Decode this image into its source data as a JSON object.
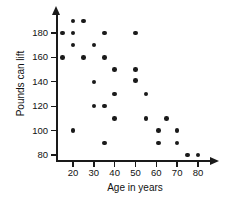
{
  "chart_data": {
    "type": "scatter",
    "title": "",
    "xlabel": "Age in years",
    "ylabel": "Pounds can lift",
    "xlim": [
      0,
      85
    ],
    "ylim": [
      70,
      195
    ],
    "grid": false,
    "legend": "none",
    "xticks": [
      20,
      30,
      40,
      50,
      60,
      70,
      80
    ],
    "yticks": [
      80,
      100,
      120,
      140,
      160,
      180
    ],
    "points": [
      {
        "x": 15,
        "y": 180
      },
      {
        "x": 15,
        "y": 160
      },
      {
        "x": 20,
        "y": 190
      },
      {
        "x": 20,
        "y": 180
      },
      {
        "x": 20,
        "y": 170
      },
      {
        "x": 20,
        "y": 100
      },
      {
        "x": 25,
        "y": 190
      },
      {
        "x": 25,
        "y": 160
      },
      {
        "x": 30,
        "y": 170
      },
      {
        "x": 30,
        "y": 140
      },
      {
        "x": 30,
        "y": 120
      },
      {
        "x": 35,
        "y": 180
      },
      {
        "x": 35,
        "y": 160
      },
      {
        "x": 35,
        "y": 120
      },
      {
        "x": 35,
        "y": 90
      },
      {
        "x": 40,
        "y": 150
      },
      {
        "x": 40,
        "y": 130
      },
      {
        "x": 40,
        "y": 110
      },
      {
        "x": 50,
        "y": 180
      },
      {
        "x": 50,
        "y": 150
      },
      {
        "x": 50,
        "y": 141
      },
      {
        "x": 55,
        "y": 130
      },
      {
        "x": 55,
        "y": 110
      },
      {
        "x": 61,
        "y": 100
      },
      {
        "x": 61,
        "y": 90
      },
      {
        "x": 65,
        "y": 110
      },
      {
        "x": 70,
        "y": 100
      },
      {
        "x": 70,
        "y": 90
      },
      {
        "x": 75,
        "y": 80
      },
      {
        "x": 80,
        "y": 80
      }
    ],
    "colors": {
      "point": "#1a1a1a",
      "axis": "#1a1a1a",
      "background": "#ffffff",
      "text": "#111111"
    }
  },
  "axes": {
    "x_title": "Age in years",
    "y_title": "Pounds can lift",
    "x_tick_labels": [
      "20",
      "30",
      "40",
      "50",
      "60",
      "70",
      "80"
    ],
    "y_tick_labels": [
      "80",
      "100",
      "120",
      "140",
      "160",
      "180"
    ]
  }
}
